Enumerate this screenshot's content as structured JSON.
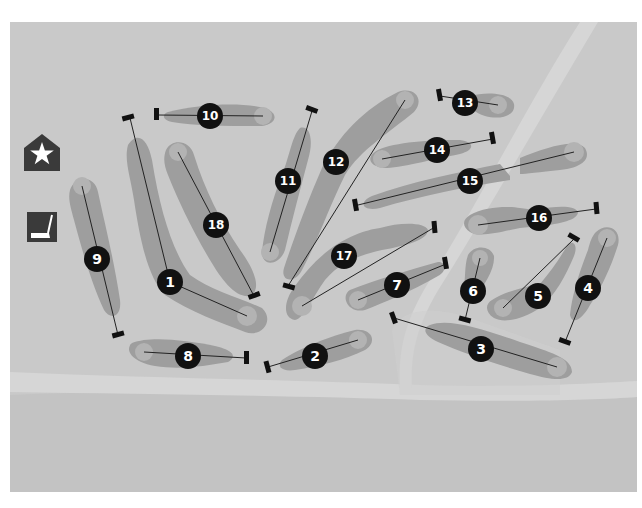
{
  "map": {
    "title": "Golf course layout",
    "colors": {
      "background": "#c9c9c9",
      "rough_light": "#d3d3d3",
      "path": "#dcdcdc",
      "lower_band": "#c2c2c2",
      "fairway": "#9e9e9e",
      "green": "#b4b4b4",
      "marker": "#111111",
      "marker_text": "#ffffff",
      "icon_bg": "#3a3a3a"
    },
    "icons": [
      {
        "name": "clubhouse-star-icon",
        "glyph": "★",
        "label": "Clubhouse"
      },
      {
        "name": "putting-green-icon",
        "glyph": "putter",
        "label": "Putting green"
      }
    ],
    "holes": [
      {
        "number": "1",
        "label_x": 170,
        "label_y": 282
      },
      {
        "number": "2",
        "label_x": 315,
        "label_y": 356
      },
      {
        "number": "3",
        "label_x": 481,
        "label_y": 349
      },
      {
        "number": "4",
        "label_x": 588,
        "label_y": 288
      },
      {
        "number": "5",
        "label_x": 538,
        "label_y": 296
      },
      {
        "number": "6",
        "label_x": 473,
        "label_y": 291
      },
      {
        "number": "7",
        "label_x": 397,
        "label_y": 285
      },
      {
        "number": "8",
        "label_x": 188,
        "label_y": 356
      },
      {
        "number": "9",
        "label_x": 97,
        "label_y": 259
      },
      {
        "number": "10",
        "label_x": 210,
        "label_y": 116
      },
      {
        "number": "11",
        "label_x": 288,
        "label_y": 181
      },
      {
        "number": "12",
        "label_x": 336,
        "label_y": 162
      },
      {
        "number": "13",
        "label_x": 465,
        "label_y": 103
      },
      {
        "number": "14",
        "label_x": 437,
        "label_y": 150
      },
      {
        "number": "15",
        "label_x": 470,
        "label_y": 181
      },
      {
        "number": "16",
        "label_x": 539,
        "label_y": 218
      },
      {
        "number": "17",
        "label_x": 344,
        "label_y": 256
      },
      {
        "number": "18",
        "label_x": 216,
        "label_y": 225
      }
    ]
  }
}
